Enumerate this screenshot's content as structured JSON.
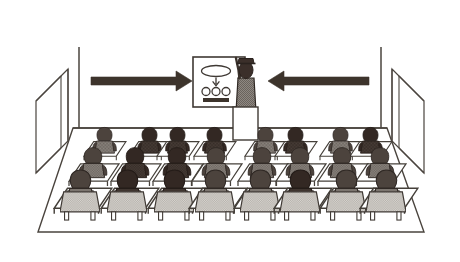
{
  "illustration": {
    "title": "Classroom lecture scene",
    "caption": "",
    "palette": {
      "background": "#ffffff",
      "outline": "#3a342f",
      "line": "#4a443e",
      "arrow": "#3d342c",
      "figure_dark": "#3b2f2a",
      "figure_mid": "#7d7670",
      "figure_light": "#b8b4ae",
      "desk_fill": "#ffffff",
      "chair_fill": "#e8e6e2",
      "board_fill": "#ffffff",
      "podium_fill": "#ffffff",
      "floor_fill": "#ffffff"
    }
  },
  "room": {
    "name": "classroom",
    "floor_label": "floor",
    "back_wall_label": "back wall",
    "left_wall_label": "left wall",
    "right_wall_label": "right wall",
    "left_window_label": "left window panel",
    "right_window_label": "right window panel"
  },
  "whiteboard": {
    "label": "whiteboard",
    "diagram": {
      "label": "flow diagram",
      "ellipse_label": "ellipse node",
      "arrow_label": "down arrow",
      "circles_count": 3,
      "circle_label": "circle node",
      "bar_label": "dark bar"
    }
  },
  "presenter": {
    "label": "teacher",
    "hat_label": "hat",
    "head_label": "head",
    "arm_label": "raised pointing arm",
    "body_label": "torso",
    "podium_label": "podium"
  },
  "arrows": {
    "left": {
      "label": "left arrow pointing right",
      "direction": "right"
    },
    "right": {
      "label": "right arrow pointing left",
      "direction": "left"
    }
  },
  "audience": {
    "label": "students",
    "total_seats": 24,
    "columns": 8,
    "rows": 3,
    "row_labels": [
      "back row",
      "middle row",
      "front row"
    ],
    "column_labels": [
      "col-1",
      "col-2",
      "col-3",
      "col-4",
      "col-5",
      "col-6",
      "col-7",
      "col-8"
    ],
    "seat_tones": [
      [
        "mid",
        "dark",
        "dark",
        "dark",
        "mid",
        "dark",
        "mid",
        "dark"
      ],
      [
        "mid",
        "dark",
        "dark",
        "mid",
        "mid",
        "mid",
        "mid",
        "mid"
      ],
      [
        "mid",
        "dark",
        "dark",
        "mid",
        "mid",
        "dark",
        "mid",
        "mid"
      ]
    ],
    "desk_label": "desk",
    "chair_label": "chair",
    "student_label": "student"
  }
}
